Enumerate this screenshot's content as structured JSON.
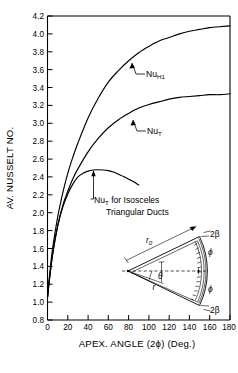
{
  "figure": {
    "background": "#ffffff",
    "ink": "#000000"
  },
  "chart_data": {
    "type": "line",
    "title": "",
    "xlabel": "APEX. ANGLE (2ϕ) (Deg.)",
    "ylabel": "AV. NUSSELT NO.",
    "xlim": [
      0,
      180
    ],
    "ylim": [
      0.8,
      4.2
    ],
    "xticks": [
      "0",
      "20",
      "40",
      "60",
      "80",
      "100",
      "120",
      "140",
      "160",
      "180"
    ],
    "xtick_values": [
      0,
      20,
      40,
      60,
      80,
      100,
      120,
      140,
      160,
      180
    ],
    "yticks": [
      "0.8",
      "1.0",
      "1.2",
      "1.4",
      "1.6",
      "1.8",
      "2.0",
      "2.2",
      "2.4",
      "2.6",
      "2.8",
      "3.0",
      "3.2",
      "3.4",
      "3.6",
      "3.8",
      "4.0",
      "4.2"
    ],
    "ytick_values": [
      0.8,
      1.0,
      1.2,
      1.4,
      1.6,
      1.8,
      2.0,
      2.2,
      2.4,
      2.6,
      2.8,
      3.0,
      3.2,
      3.4,
      3.6,
      3.8,
      4.0,
      4.2
    ],
    "grid": false,
    "legend_position": "inline-annotations",
    "series": [
      {
        "name": "Nu_H1",
        "label": "Nu",
        "label_sub": "H1",
        "x": [
          0,
          2,
          5,
          10,
          15,
          20,
          25,
          30,
          40,
          50,
          60,
          70,
          80,
          90,
          100,
          110,
          120,
          130,
          140,
          150,
          160,
          170,
          180
        ],
        "values": [
          1.06,
          1.3,
          1.6,
          1.95,
          2.22,
          2.44,
          2.62,
          2.78,
          3.06,
          3.28,
          3.46,
          3.59,
          3.7,
          3.79,
          3.86,
          3.92,
          3.96,
          4.0,
          4.03,
          4.05,
          4.07,
          4.08,
          4.09
        ]
      },
      {
        "name": "Nu_T",
        "label": "Nu",
        "label_sub": "T",
        "x": [
          0,
          2,
          5,
          10,
          15,
          20,
          25,
          30,
          40,
          50,
          60,
          70,
          80,
          90,
          100,
          110,
          120,
          130,
          140,
          150,
          160,
          170,
          180
        ],
        "values": [
          1.05,
          1.26,
          1.53,
          1.85,
          2.08,
          2.24,
          2.38,
          2.49,
          2.68,
          2.83,
          2.95,
          3.04,
          3.11,
          3.17,
          3.21,
          3.24,
          3.27,
          3.29,
          3.3,
          3.31,
          3.32,
          3.32,
          3.33
        ]
      },
      {
        "name": "Nu_T_isosceles",
        "label": "Nu",
        "label_sub": "T",
        "x": [
          0,
          2,
          5,
          10,
          15,
          20,
          25,
          30,
          35,
          40,
          45,
          50,
          55,
          60,
          65,
          70,
          75,
          80,
          85,
          90
        ],
        "values": [
          1.05,
          1.26,
          1.53,
          1.85,
          2.06,
          2.21,
          2.32,
          2.4,
          2.44,
          2.465,
          2.478,
          2.481,
          2.478,
          2.47,
          2.455,
          2.43,
          2.405,
          2.375,
          2.345,
          2.31
        ]
      }
    ],
    "annotations": [
      {
        "id": "nu-h1-annotation",
        "text": "Nu",
        "sub": "H1"
      },
      {
        "id": "nu-t-annotation",
        "text": "Nu",
        "sub": "T"
      },
      {
        "id": "nu-t-isosceles-annotation",
        "text_before": "Nu",
        "sub": "T",
        "text_after": " for Isosceles",
        "line2": "Triangular Ducts"
      }
    ]
  },
  "inset": {
    "name": "circular-sector-duct-diagram",
    "labels": {
      "r0": "r",
      "r0_sub": "0",
      "beta_top": "2β",
      "beta_bottom": "2β",
      "phi_top": "ϕ",
      "phi_bottom": "ϕ",
      "theta": "θ",
      "r": "r"
    }
  }
}
